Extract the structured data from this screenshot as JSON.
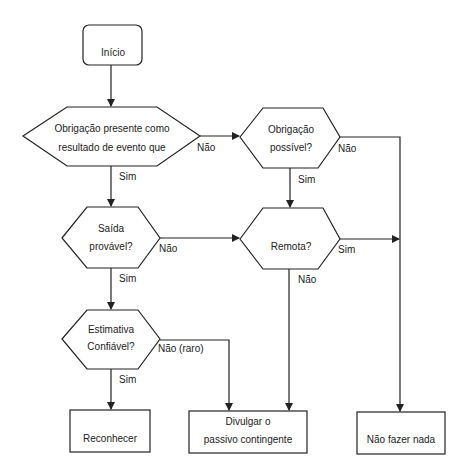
{
  "nodes": {
    "start": {
      "label": "Início"
    },
    "present_obligation": {
      "line1": "Obrigação presente como",
      "line2": "resultado de evento que"
    },
    "possible_obligation": {
      "line1": "Obrigação",
      "line2": "possível?"
    },
    "probable_outflow": {
      "line1": "Saída",
      "line2": "provável?"
    },
    "remote": {
      "label": "Remota?"
    },
    "reliable_estimate": {
      "line1": "Estimativa",
      "line2": "Confiável?"
    },
    "recognize": {
      "label": "Reconhecer"
    },
    "disclose": {
      "line1": "Divulgar o",
      "line2": "passivo contingente"
    },
    "do_nothing": {
      "label": "Não fazer nada"
    }
  },
  "edges": {
    "present_no": "Não",
    "present_yes": "Sim",
    "possible_no": "Não",
    "possible_yes": "Sim",
    "probable_no": "Não",
    "probable_yes": "Sim",
    "remote_yes": "Sim",
    "remote_no": "Não",
    "estimate_no": "Não (raro)",
    "estimate_yes": "Sim"
  },
  "colors": {
    "stroke": "#222222",
    "background": "#ffffff"
  }
}
